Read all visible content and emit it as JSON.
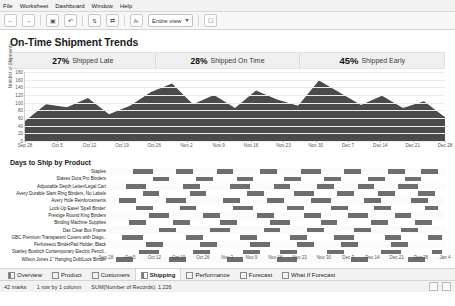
{
  "menubar": {
    "items": [
      "File",
      "Worksheet",
      "Dashboard",
      "Window",
      "Help"
    ]
  },
  "toolbar": {
    "icons": [
      "back-icon",
      "forward-icon",
      "save-icon",
      "undo-icon",
      "redo-icon",
      "sort-icon",
      "swap-icon",
      "highlight-icon"
    ],
    "view_select": "Entire view",
    "presentation_label": "presentation-icon"
  },
  "dashboard": {
    "title": "On-Time Shipment Trends",
    "kpis": [
      {
        "value": "27%",
        "label": "Shipped Late"
      },
      {
        "value": "28%",
        "label": "Shipped On Time"
      },
      {
        "value": "45%",
        "label": "Shipped Early"
      }
    ],
    "section2_title": "Days to Ship by Product"
  },
  "chart_data": [
    {
      "type": "area",
      "title": "On-Time Shipment Trends",
      "xlabel": "",
      "ylabel": "Number of Shipments",
      "ylim": [
        0,
        180
      ],
      "yticks": [
        0,
        20,
        40,
        60,
        80,
        100,
        120,
        140,
        160,
        180
      ],
      "grid": true,
      "legend": "none",
      "categories": [
        "Sep 28",
        "Oct 5",
        "Oct 12",
        "Oct 19",
        "Oct 26",
        "Nov 2",
        "Nov 9",
        "Nov 16",
        "Nov 23",
        "Nov 30",
        "Dec 7",
        "Dec 14",
        "Dec 21",
        "Dec 28"
      ],
      "x": [
        0,
        1,
        2,
        3,
        4,
        5,
        6,
        7,
        8,
        9,
        10,
        11,
        12,
        13,
        14,
        15,
        16,
        17,
        18,
        19,
        20
      ],
      "series": [
        {
          "name": "Number of Shipments",
          "color": "#4a4a4a",
          "values": [
            52,
            96,
            88,
            112,
            70,
            92,
            128,
            150,
            96,
            120,
            86,
            132,
            108,
            92,
            158,
            126,
            94,
            118,
            86,
            104,
            62
          ]
        }
      ]
    },
    {
      "type": "gantt",
      "title": "Days to Ship by Product",
      "xlabel": "",
      "ylabel": "Product",
      "xticks": [
        "Sep 28",
        "Oct 5",
        "Oct 12",
        "Oct 19",
        "Oct 26",
        "Nov 2",
        "Nov 9",
        "Nov 16",
        "Nov 23",
        "Nov 30",
        "Dec 7",
        "Dec 14",
        "Dec 21",
        "Dec 28",
        "Jan 4"
      ],
      "rows": [
        {
          "label": "Staples",
          "bars": [
            [
              0.07,
              0.06
            ],
            [
              0.2,
              0.05
            ],
            [
              0.32,
              0.05
            ],
            [
              0.45,
              0.05
            ],
            [
              0.57,
              0.06
            ],
            [
              0.7,
              0.05
            ],
            [
              0.83,
              0.05
            ],
            [
              0.93,
              0.05
            ]
          ],
          "color": "#6e6e6e"
        },
        {
          "label": "Staves Dura Pro Binders",
          "bars": [
            [
              0.13,
              0.05
            ],
            [
              0.26,
              0.05
            ],
            [
              0.38,
              0.05
            ],
            [
              0.52,
              0.05
            ],
            [
              0.64,
              0.05
            ],
            [
              0.77,
              0.05
            ],
            [
              0.88,
              0.05
            ]
          ],
          "color": "#6e6e6e"
        },
        {
          "label": "Adjustable Depth Letter/Legal Cart",
          "bars": [
            [
              0.05,
              0.06
            ],
            [
              0.22,
              0.05
            ],
            [
              0.36,
              0.06
            ],
            [
              0.49,
              0.05
            ],
            [
              0.62,
              0.05
            ],
            [
              0.74,
              0.05
            ],
            [
              0.86,
              0.06
            ]
          ],
          "color": "#6e6e6e"
        },
        {
          "label": "Avery Durable Slant Ring Binders, No Labels",
          "bars": [
            [
              0.1,
              0.05
            ],
            [
              0.24,
              0.05
            ],
            [
              0.41,
              0.05
            ],
            [
              0.55,
              0.06
            ],
            [
              0.68,
              0.05
            ],
            [
              0.8,
              0.05
            ],
            [
              0.92,
              0.05
            ]
          ],
          "color": "#6e6e6e"
        },
        {
          "label": "Avery Hole Reinforcements",
          "bars": [
            [
              0.03,
              0.05
            ],
            [
              0.17,
              0.06
            ],
            [
              0.34,
              0.05
            ],
            [
              0.47,
              0.05
            ],
            [
              0.6,
              0.06
            ],
            [
              0.76,
              0.05
            ],
            [
              0.9,
              0.05
            ]
          ],
          "color": "#6e6e6e"
        },
        {
          "label": "Lock-Up Easel 'Spell Binder'",
          "bars": [
            [
              0.08,
              0.05
            ],
            [
              0.21,
              0.05
            ],
            [
              0.37,
              0.06
            ],
            [
              0.53,
              0.05
            ],
            [
              0.66,
              0.05
            ],
            [
              0.79,
              0.05
            ],
            [
              0.94,
              0.04
            ]
          ],
          "color": "#6e6e6e"
        },
        {
          "label": "Prestige Round King Binders",
          "bars": [
            [
              0.12,
              0.06
            ],
            [
              0.28,
              0.05
            ],
            [
              0.44,
              0.05
            ],
            [
              0.58,
              0.05
            ],
            [
              0.71,
              0.06
            ],
            [
              0.85,
              0.05
            ]
          ],
          "color": "#6e6e6e"
        },
        {
          "label": "Binding Machine Supplies",
          "bars": [
            [
              0.06,
              0.05
            ],
            [
              0.19,
              0.05
            ],
            [
              0.33,
              0.05
            ],
            [
              0.48,
              0.06
            ],
            [
              0.63,
              0.05
            ],
            [
              0.78,
              0.05
            ],
            [
              0.91,
              0.05
            ]
          ],
          "color": "#6e6e6e"
        },
        {
          "label": "Dax Clear Box Frame",
          "bars": [
            [
              0.15,
              0.05
            ],
            [
              0.3,
              0.06
            ],
            [
              0.46,
              0.05
            ],
            [
              0.59,
              0.05
            ],
            [
              0.73,
              0.05
            ],
            [
              0.87,
              0.05
            ]
          ],
          "color": "#6e6e6e"
        },
        {
          "label": "GBC Premium Transparent Covers with Diago..",
          "bars": [
            [
              0.04,
              0.06
            ],
            [
              0.23,
              0.05
            ],
            [
              0.39,
              0.05
            ],
            [
              0.54,
              0.05
            ],
            [
              0.67,
              0.06
            ],
            [
              0.82,
              0.05
            ],
            [
              0.95,
              0.04
            ]
          ],
          "color": "#6e6e6e"
        },
        {
          "label": "Perforeeco BinderPad Holder, Black",
          "bars": [
            [
              0.11,
              0.05
            ],
            [
              0.27,
              0.05
            ],
            [
              0.42,
              0.06
            ],
            [
              0.56,
              0.05
            ],
            [
              0.69,
              0.05
            ],
            [
              0.84,
              0.05
            ]
          ],
          "color": "#6e6e6e"
        },
        {
          "label": "Stanley Bostitch Contemporary Electric Pencil..",
          "bars": [
            [
              0.09,
              0.06
            ],
            [
              0.25,
              0.05
            ],
            [
              0.4,
              0.05
            ],
            [
              0.51,
              0.05
            ],
            [
              0.65,
              0.05
            ],
            [
              0.81,
              0.06
            ],
            [
              0.96,
              0.03
            ]
          ],
          "color": "#6e6e6e"
        },
        {
          "label": "Wilson Jones 1\" Hanging DublLock Binder",
          "bars": [
            [
              0.02,
              0.05
            ],
            [
              0.18,
              0.05
            ],
            [
              0.35,
              0.05
            ],
            [
              0.5,
              0.06
            ],
            [
              0.72,
              0.05
            ],
            [
              0.89,
              0.05
            ]
          ],
          "color": "#6e6e6e"
        }
      ]
    }
  ],
  "tabs": [
    {
      "label": "Overview",
      "icon": "dashboard-icon",
      "active": false
    },
    {
      "label": "Product",
      "icon": "sheet-icon",
      "active": false
    },
    {
      "label": "Customers",
      "icon": "sheet-icon",
      "active": false
    },
    {
      "label": "Shipping",
      "icon": "dashboard-icon",
      "active": true
    },
    {
      "label": "Performance",
      "icon": "sheet-icon",
      "active": false
    },
    {
      "label": "Forecast",
      "icon": "sheet-icon",
      "active": false
    },
    {
      "label": "What If Forecast",
      "icon": "sheet-icon",
      "active": false
    }
  ],
  "statusbar": {
    "marks": "42 marks",
    "rows_cols": "1 row by 1 column",
    "aggregate": "SUM(Number of Records): 1,226"
  }
}
